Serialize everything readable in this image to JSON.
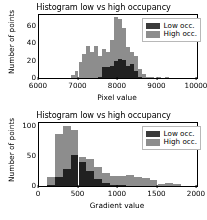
{
  "figure": {
    "background": "#ffffff",
    "low_color": "#3b3b3b",
    "high_color": "#8d8d8d",
    "overlap_color": "#2a2a2a",
    "axis_color": "#000000",
    "caption_text": ""
  },
  "chart_data": [
    {
      "type": "bar",
      "id": "pixel-value-histogram",
      "title": "Histogram low vs high occupancy",
      "xlabel": "Pixel value",
      "ylabel": "Number of points",
      "xlim": [
        6000,
        10000
      ],
      "ylim": [
        0,
        72
      ],
      "xticks": [
        6000,
        7000,
        8000,
        9000,
        10000
      ],
      "xticklabels": [
        "6000",
        "7000",
        "8000",
        "9000",
        "10000"
      ],
      "yticks": [
        0,
        20,
        40,
        60
      ],
      "yticklabels": [
        "0",
        "20",
        "40",
        "60"
      ],
      "grid": false,
      "legend_position": "upper right",
      "bin_width": 100,
      "series": [
        {
          "name": "Low occ.",
          "color": "#3b3b3b",
          "bin_starts": [
            7500,
            7600,
            7700,
            7800,
            7900,
            8000,
            8100,
            8200,
            8300,
            8400,
            8500
          ],
          "values": [
            1,
            13,
            13,
            14,
            20,
            22,
            21,
            14,
            16,
            8,
            1
          ]
        },
        {
          "name": "High occ.",
          "color": "#8d8d8d",
          "bin_starts": [
            6800,
            6900,
            7000,
            7100,
            7200,
            7300,
            7400,
            7500,
            7600,
            7700,
            7800,
            7900,
            8000,
            8100,
            8200,
            8300,
            8400,
            8500,
            8600,
            8700,
            8800,
            8900,
            9000,
            9100,
            9200
          ],
          "values": [
            3,
            8,
            18,
            27,
            37,
            30,
            37,
            25,
            33,
            30,
            43,
            70,
            68,
            57,
            36,
            30,
            25,
            10,
            5,
            1,
            1,
            0,
            1,
            0,
            1
          ]
        }
      ],
      "legend": [
        {
          "label": "Low occ.",
          "color": "#3b3b3b"
        },
        {
          "label": "High occ.",
          "color": "#8d8d8d"
        }
      ]
    },
    {
      "type": "bar",
      "id": "gradient-value-histogram",
      "title": "Histogram low vs high occupancy",
      "xlabel": "Gradient value",
      "ylabel": "Number of points",
      "xlim": [
        0,
        2000
      ],
      "ylim": [
        0,
        105
      ],
      "xticks": [
        0,
        500,
        1000,
        1500,
        2000
      ],
      "xticklabels": [
        "0",
        "500",
        "1000",
        "1500",
        "2000"
      ],
      "yticks": [
        0,
        50,
        100
      ],
      "yticklabels": [
        "0",
        "50",
        "100"
      ],
      "grid": false,
      "legend_position": "upper right",
      "bin_width": 100,
      "series": [
        {
          "name": "Low occ.",
          "color": "#3b3b3b",
          "bin_starts": [
            100,
            200,
            300,
            400,
            500,
            600,
            700,
            800,
            900,
            1000
          ],
          "values": [
            2,
            15,
            28,
            51,
            40,
            25,
            12,
            5,
            2,
            1
          ]
        },
        {
          "name": "High occ.",
          "color": "#8d8d8d",
          "bin_starts": [
            100,
            200,
            300,
            400,
            500,
            600,
            700,
            800,
            900,
            1000,
            1100,
            1200,
            1300,
            1400,
            1500,
            1600,
            1700
          ],
          "values": [
            15,
            86,
            100,
            93,
            49,
            45,
            32,
            22,
            16,
            17,
            19,
            15,
            13,
            10,
            4,
            5,
            4
          ]
        }
      ],
      "legend": [
        {
          "label": "Low occ.",
          "color": "#3b3b3b"
        },
        {
          "label": "High occ.",
          "color": "#8d8d8d"
        }
      ]
    }
  ]
}
